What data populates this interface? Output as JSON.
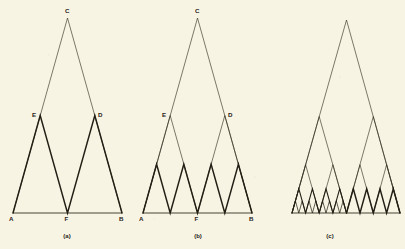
{
  "figure": {
    "kind": "geometric-construction-diagram",
    "background_color": "#f7f4e4",
    "line_color": "#241e14",
    "envelope_line_color": "#2f2a1e",
    "base_line_color": "#4a4436",
    "width": 405,
    "height": 249
  },
  "panels": [
    {
      "id": "panel-a",
      "caption": "(a)",
      "caption_x": 67,
      "caption_y": 238,
      "stage": 1,
      "base": {
        "left_x": 13,
        "right_x": 122,
        "y": 213
      },
      "apex": {
        "x": 67.5,
        "y": 18
      },
      "labels": [
        {
          "text": "A",
          "x": 9,
          "y": 221,
          "vertex": "base-left"
        },
        {
          "text": "F",
          "x": 64.5,
          "y": 221,
          "vertex": "base-mid"
        },
        {
          "text": "B",
          "x": 119,
          "y": 221,
          "vertex": "base-right"
        },
        {
          "text": "E",
          "x": 32,
          "y": 117,
          "vertex": "left-sub-apex"
        },
        {
          "text": "D",
          "x": 98,
          "y": 117,
          "vertex": "right-sub-apex"
        },
        {
          "text": "C",
          "x": 65,
          "y": 13,
          "vertex": "main-apex"
        }
      ],
      "envelope": "A-C-B outline of the large triangle",
      "generation": "bold zig-zag A-E-F-D-B (two sub-triangles)"
    },
    {
      "id": "panel-b",
      "caption": "(b)",
      "caption_x": 198,
      "caption_y": 238,
      "stage": 2,
      "base": {
        "left_x": 143,
        "right_x": 252,
        "y": 213
      },
      "apex": {
        "x": 197.5,
        "y": 18
      },
      "labels": [
        {
          "text": "A",
          "x": 139,
          "y": 221,
          "vertex": "base-left"
        },
        {
          "text": "F",
          "x": 194.5,
          "y": 221,
          "vertex": "base-mid"
        },
        {
          "text": "B",
          "x": 249,
          "y": 221,
          "vertex": "base-right"
        },
        {
          "text": "E",
          "x": 162,
          "y": 117,
          "vertex": "left-sub-apex"
        },
        {
          "text": "D",
          "x": 228,
          "y": 117,
          "vertex": "right-sub-apex"
        },
        {
          "text": "C",
          "x": 195,
          "y": 13,
          "vertex": "main-apex"
        }
      ],
      "envelope": "A-C-B outline plus thin A-E-F-D-B zig-zag",
      "generation": "bold zig-zag of four sub-triangles along the base"
    },
    {
      "id": "panel-c",
      "caption": "(c)",
      "caption_x": 330,
      "caption_y": 238,
      "stage": 4,
      "base": {
        "left_x": 292,
        "right_x": 400,
        "y": 213
      },
      "apex": {
        "x": 346.5,
        "y": 20
      },
      "labels": [],
      "envelope": "thin outline of the large triangle and the first two subdivision levels",
      "generation": "dense bold zig-zag; left half subdivided one level deeper than right half"
    }
  ],
  "chart_data": {
    "type": "line",
    "title": "",
    "subtitle": "",
    "xlabel": "",
    "ylabel": "",
    "series": [
      {
        "name": "panel-a-envelope",
        "panel": "panel-a",
        "style": "thin",
        "points": [
          [
            13,
            213
          ],
          [
            67.5,
            18
          ],
          [
            122,
            213
          ]
        ]
      },
      {
        "name": "panel-a-baseline",
        "panel": "panel-a",
        "style": "base",
        "points": [
          [
            13,
            213
          ],
          [
            122,
            213
          ]
        ]
      },
      {
        "name": "panel-a-generation",
        "panel": "panel-a",
        "style": "bold",
        "points": [
          [
            13,
            213
          ],
          [
            40.2,
            115.5
          ],
          [
            67.5,
            213
          ],
          [
            94.8,
            115.5
          ],
          [
            122,
            213
          ]
        ]
      },
      {
        "name": "panel-b-envelope",
        "panel": "panel-b",
        "style": "thin",
        "points": [
          [
            143,
            213
          ],
          [
            197.5,
            18
          ],
          [
            252,
            213
          ]
        ]
      },
      {
        "name": "panel-b-level1",
        "panel": "panel-b",
        "style": "thin",
        "points": [
          [
            143,
            213
          ],
          [
            170.2,
            115.5
          ],
          [
            197.5,
            213
          ],
          [
            224.8,
            115.5
          ],
          [
            252,
            213
          ]
        ]
      },
      {
        "name": "panel-b-baseline",
        "panel": "panel-b",
        "style": "base",
        "points": [
          [
            143,
            213
          ],
          [
            252,
            213
          ]
        ]
      },
      {
        "name": "panel-b-generation",
        "panel": "panel-b",
        "style": "bold",
        "points": [
          [
            143,
            213
          ],
          [
            156.6,
            164.2
          ],
          [
            170.2,
            213
          ],
          [
            183.8,
            164.2
          ],
          [
            197.5,
            213
          ],
          [
            211.1,
            164.2
          ],
          [
            224.8,
            213
          ],
          [
            238.4,
            164.2
          ],
          [
            252,
            213
          ]
        ]
      },
      {
        "name": "panel-c-envelope",
        "panel": "panel-c",
        "style": "thin",
        "points": [
          [
            292,
            213
          ],
          [
            346.5,
            20
          ],
          [
            400,
            213
          ]
        ]
      },
      {
        "name": "panel-c-level1",
        "panel": "panel-c",
        "style": "thin",
        "points": [
          [
            292,
            213
          ],
          [
            319.2,
            116.5
          ],
          [
            346.5,
            213
          ],
          [
            373.3,
            116.5
          ],
          [
            400,
            213
          ]
        ]
      },
      {
        "name": "panel-c-level2",
        "panel": "panel-c",
        "style": "thin",
        "points": [
          [
            292,
            213
          ],
          [
            305.6,
            164.7
          ],
          [
            319.2,
            213
          ],
          [
            332.9,
            164.7
          ],
          [
            346.5,
            213
          ],
          [
            360.0,
            164.7
          ],
          [
            373.3,
            213
          ],
          [
            386.6,
            164.7
          ],
          [
            400,
            213
          ]
        ]
      },
      {
        "name": "panel-c-baseline",
        "panel": "panel-c",
        "style": "base",
        "points": [
          [
            292,
            213
          ],
          [
            400,
            213
          ]
        ]
      },
      {
        "name": "panel-c-generation-right",
        "panel": "panel-c",
        "style": "bold",
        "points": [
          [
            346.5,
            213
          ],
          [
            353.3,
            188.8
          ],
          [
            360.0,
            213
          ],
          [
            366.7,
            188.8
          ],
          [
            373.3,
            213
          ],
          [
            380.0,
            188.8
          ],
          [
            386.6,
            213
          ],
          [
            393.3,
            188.8
          ],
          [
            400,
            213
          ]
        ]
      },
      {
        "name": "panel-c-generation-left",
        "panel": "panel-c",
        "style": "micro",
        "points": [
          [
            292,
            213
          ],
          [
            295.4,
            200.9
          ],
          [
            298.8,
            213
          ],
          [
            302.2,
            200.9
          ],
          [
            305.6,
            213
          ],
          [
            309.0,
            200.9
          ],
          [
            312.4,
            213
          ],
          [
            315.8,
            200.9
          ],
          [
            319.2,
            213
          ],
          [
            322.6,
            200.9
          ],
          [
            326.0,
            213
          ],
          [
            329.5,
            200.9
          ],
          [
            332.9,
            213
          ],
          [
            336.3,
            200.9
          ],
          [
            339.7,
            213
          ],
          [
            343.1,
            200.9
          ],
          [
            346.5,
            213
          ]
        ]
      },
      {
        "name": "panel-c-generation-left-mid",
        "panel": "panel-c",
        "style": "fine",
        "points": [
          [
            292,
            213
          ],
          [
            298.8,
            188.8
          ],
          [
            305.6,
            213
          ],
          [
            312.4,
            188.8
          ],
          [
            319.2,
            213
          ],
          [
            326.0,
            188.8
          ],
          [
            332.9,
            213
          ],
          [
            339.7,
            188.8
          ],
          [
            346.5,
            213
          ]
        ]
      }
    ]
  }
}
